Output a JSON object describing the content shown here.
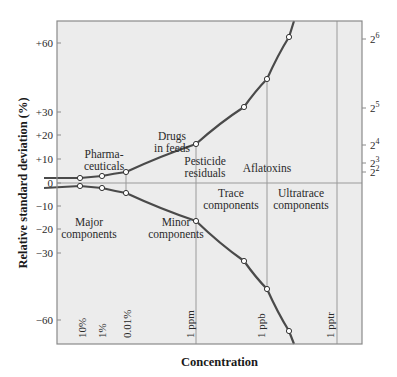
{
  "chart_data": {
    "type": "line",
    "title": "",
    "xlabel": "Concentration",
    "ylabel": "Relative standard deviation (%)",
    "y_ticks": [
      {
        "value": 60,
        "label": "+60"
      },
      {
        "value": 30,
        "label": "+30"
      },
      {
        "value": 20,
        "label": "+20"
      },
      {
        "value": 10,
        "label": "+10"
      },
      {
        "value": 0,
        "label": "0"
      },
      {
        "value": -10,
        "label": "−10"
      },
      {
        "value": -20,
        "label": "−20"
      },
      {
        "value": -30,
        "label": "−30"
      },
      {
        "value": -60,
        "label": "−60"
      }
    ],
    "right_ticks": [
      {
        "value": 64,
        "base": "2",
        "exp": "6"
      },
      {
        "value": 32,
        "base": "2",
        "exp": "5"
      },
      {
        "value": 16,
        "base": "2",
        "exp": "4"
      },
      {
        "value": 8,
        "base": "2",
        "exp": "3"
      },
      {
        "value": 4,
        "base": "2",
        "exp": "2"
      }
    ],
    "x_ticks": [
      {
        "log10_conc": -1,
        "label": "10%"
      },
      {
        "log10_conc": -2,
        "label": "1%"
      },
      {
        "log10_conc": -4,
        "label": "0.01%"
      },
      {
        "log10_conc": -6,
        "label": "1 ppm"
      },
      {
        "log10_conc": -9,
        "label": "1 ppb"
      },
      {
        "log10_conc": -12,
        "label": "1 pptr"
      }
    ],
    "series": [
      {
        "name": "upper",
        "points": [
          {
            "log10_conc": -1,
            "rsd": 2.0
          },
          {
            "log10_conc": -2,
            "rsd": 2.8
          },
          {
            "log10_conc": -4,
            "rsd": 4.0
          },
          {
            "log10_conc": -6,
            "rsd": 16
          },
          {
            "log10_conc": -8,
            "rsd": 32
          },
          {
            "log10_conc": -9,
            "rsd": 45
          },
          {
            "log10_conc": -10,
            "rsd": 64
          }
        ]
      },
      {
        "name": "lower",
        "points": [
          {
            "log10_conc": -1,
            "rsd": -2.0
          },
          {
            "log10_conc": -2,
            "rsd": -2.8
          },
          {
            "log10_conc": -4,
            "rsd": -4.0
          },
          {
            "log10_conc": -6,
            "rsd": -16
          },
          {
            "log10_conc": -8,
            "rsd": -32
          },
          {
            "log10_conc": -9,
            "rsd": -45
          },
          {
            "log10_conc": -10,
            "rsd": -64
          }
        ]
      }
    ],
    "annotations": {
      "pharma": [
        "Pharma-",
        "ceuticals"
      ],
      "drugs": [
        "Drugs",
        "in feeds"
      ],
      "pesticide": [
        "Pesticide",
        "residuals"
      ],
      "aflatoxins": [
        "Aflatoxins"
      ],
      "major": [
        "Major",
        "components"
      ],
      "minor": [
        "Minor",
        "components"
      ],
      "trace": [
        "Trace",
        "components"
      ],
      "ultratrace": [
        "Ultratrace",
        "components"
      ]
    },
    "grid": false,
    "legend": "none"
  },
  "colors": {
    "plot_bg": "#ececec",
    "frame": "#8a8a8a",
    "curve": "#4a4a4a",
    "guide": "#9a9a9a"
  }
}
